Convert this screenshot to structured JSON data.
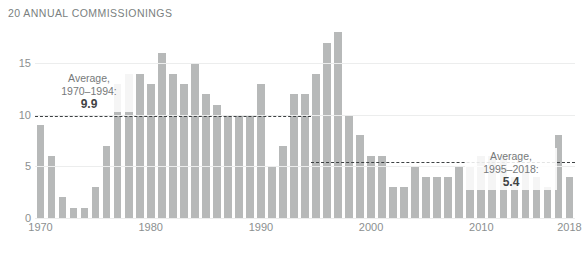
{
  "chart_data": {
    "type": "bar",
    "title": "20 ANNUAL COMMISSIONINGS",
    "xlabel": "",
    "ylabel": "",
    "ylim": [
      0,
      19
    ],
    "yticks": [
      0,
      5,
      10,
      15
    ],
    "ytick_labels": [
      "0",
      "5",
      "10",
      "15"
    ],
    "xticks": [
      1970,
      1980,
      1990,
      2000,
      2010,
      2018
    ],
    "xtick_labels": [
      "1970",
      "1980",
      "1990",
      "2000",
      "2010",
      "2018"
    ],
    "grid": true,
    "legend": "none",
    "bar_color": "#b7b9b9",
    "categories": [
      1970,
      1971,
      1972,
      1973,
      1974,
      1975,
      1976,
      1977,
      1978,
      1979,
      1980,
      1981,
      1982,
      1983,
      1984,
      1985,
      1986,
      1987,
      1988,
      1989,
      1990,
      1991,
      1992,
      1993,
      1994,
      1995,
      1996,
      1997,
      1998,
      1999,
      2000,
      2001,
      2002,
      2003,
      2004,
      2005,
      2006,
      2007,
      2008,
      2009,
      2010,
      2011,
      2012,
      2013,
      2014,
      2015,
      2016,
      2017,
      2018
    ],
    "values": [
      9,
      6,
      2,
      1,
      1,
      3,
      7,
      13,
      14,
      14,
      13,
      16,
      14,
      13,
      15,
      12,
      11,
      10,
      10,
      10,
      13,
      5,
      7,
      12,
      12,
      14,
      17,
      18,
      10,
      8,
      6,
      6,
      3,
      3,
      5,
      4,
      4,
      4,
      5,
      5,
      6,
      6,
      6,
      4,
      5,
      4,
      3,
      8,
      4
    ],
    "annotations": [
      {
        "id": "avg-1970-1994",
        "label_line1": "Average,",
        "label_line2": "1970–1994:",
        "value": "9.9",
        "numeric_value": 9.9,
        "x_start": 1970,
        "x_end": 1994
      },
      {
        "id": "avg-1995-2018",
        "label_line1": "Average,",
        "label_line2": "1995–2018:",
        "value": "5.4",
        "numeric_value": 5.4,
        "x_start": 1995,
        "x_end": 2018
      }
    ]
  },
  "colors": {
    "bar": "#b7b9b9",
    "grid": "#eceded",
    "text": "#8b8f90",
    "title": "#7a7f80",
    "average_line": "#3c4042",
    "value_text": "#3f4345",
    "background": "#ffffff"
  }
}
